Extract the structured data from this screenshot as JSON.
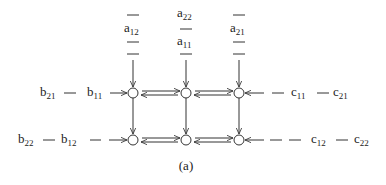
{
  "caption": "(a)",
  "colors": {
    "stroke": "#333333",
    "text": "#222222",
    "background": "#ffffff"
  },
  "nodes": [
    {
      "id": "n11",
      "row": 1,
      "col": 1,
      "x": 133,
      "y": 93
    },
    {
      "id": "n12",
      "row": 1,
      "col": 2,
      "x": 186,
      "y": 93
    },
    {
      "id": "n13",
      "row": 1,
      "col": 3,
      "x": 239,
      "y": 93
    },
    {
      "id": "n21",
      "row": 2,
      "col": 1,
      "x": 133,
      "y": 140
    },
    {
      "id": "n22",
      "row": 2,
      "col": 2,
      "x": 186,
      "y": 140
    },
    {
      "id": "n23",
      "row": 2,
      "col": 3,
      "x": 239,
      "y": 140
    }
  ],
  "top_inputs": [
    {
      "column": 1,
      "sequence": [
        "—",
        "a",
        "—",
        "—"
      ],
      "subscripts": [
        "",
        "12",
        "",
        ""
      ]
    },
    {
      "column": 2,
      "sequence": [
        "a",
        "—",
        "a",
        "—"
      ],
      "subscripts": [
        "22",
        "",
        "11",
        ""
      ]
    },
    {
      "column": 3,
      "sequence": [
        "—",
        "a",
        "—",
        "—"
      ],
      "subscripts": [
        "",
        "21",
        "",
        ""
      ]
    }
  ],
  "left_inputs": [
    {
      "row": 1,
      "items": [
        {
          "base": "b",
          "sub": "21"
        },
        {
          "base": "—"
        },
        {
          "base": "b",
          "sub": "11"
        }
      ]
    },
    {
      "row": 2,
      "items": [
        {
          "base": "b",
          "sub": "22"
        },
        {
          "base": "—"
        },
        {
          "base": "b",
          "sub": "12"
        },
        {
          "base": "—"
        }
      ]
    }
  ],
  "right_inputs": [
    {
      "row": 1,
      "items": [
        {
          "base": "—"
        },
        {
          "base": "c",
          "sub": "11"
        },
        {
          "base": "—"
        },
        {
          "base": "c",
          "sub": "21"
        }
      ]
    },
    {
      "row": 2,
      "items": [
        {
          "base": "—"
        },
        {
          "base": "—"
        },
        {
          "base": "c",
          "sub": "12"
        },
        {
          "base": "—"
        },
        {
          "base": "c",
          "sub": "22"
        }
      ]
    }
  ],
  "labels": {
    "a12": {
      "base": "a",
      "sub": "12"
    },
    "a22": {
      "base": "a",
      "sub": "22"
    },
    "a11": {
      "base": "a",
      "sub": "11"
    },
    "a21": {
      "base": "a",
      "sub": "21"
    },
    "b21": {
      "base": "b",
      "sub": "21"
    },
    "b11": {
      "base": "b",
      "sub": "11"
    },
    "b22": {
      "base": "b",
      "sub": "22"
    },
    "b12": {
      "base": "b",
      "sub": "12"
    },
    "c11": {
      "base": "c",
      "sub": "11"
    },
    "c21": {
      "base": "c",
      "sub": "21"
    },
    "c12": {
      "base": "c",
      "sub": "12"
    },
    "c22": {
      "base": "c",
      "sub": "22"
    },
    "dash": "—"
  }
}
